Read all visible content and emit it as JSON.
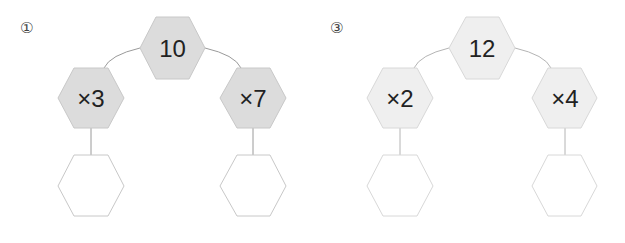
{
  "colors": {
    "problem1_fill": "#dcdcdc",
    "problem3_fill": "#efefef",
    "empty_fill": "#ffffff",
    "stroke": "#c8c8c8",
    "connector": "#9a9a9a",
    "text": "#222222"
  },
  "problems": [
    {
      "label": "①",
      "top": "10",
      "left_op": "×3",
      "right_op": "×7",
      "left_answer": "",
      "right_answer": ""
    },
    {
      "label": "③",
      "top": "12",
      "left_op": "×2",
      "right_op": "×4",
      "left_answer": "",
      "right_answer": ""
    }
  ]
}
